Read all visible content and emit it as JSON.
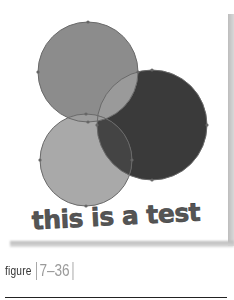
{
  "figure": {
    "art_text": "this is a test",
    "caption_word": "figure",
    "caption_number": "7–36"
  },
  "colors": {
    "top_circle": "#8c8c8c",
    "dark_circle": "#3a3a3a",
    "bottom_circle": "#a9a9a9",
    "outline": "#6a6a6a",
    "text": "#555555"
  }
}
